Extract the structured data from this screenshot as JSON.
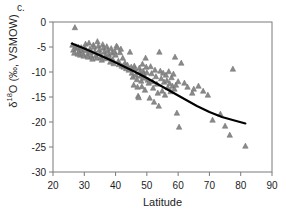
{
  "panel": {
    "label": "c."
  },
  "axes": {
    "xlabel": "Latitude",
    "ylabel_main": "O (‰, VSMOW)",
    "ylabel_delta": "δ",
    "ylabel_sup": "18",
    "x_ticks": [
      20,
      30,
      40,
      50,
      60,
      70,
      80,
      90
    ],
    "y_ticks": [
      0,
      -5,
      -10,
      -15,
      -20,
      -25,
      -30
    ]
  },
  "style": {
    "marker_color": "#8a8a8a",
    "marker_edge": "#6e6e6e",
    "trend_color": "#000000",
    "axis_color": "#7a7a7a",
    "text_color": "#1d1d1d"
  },
  "chart_data": {
    "type": "scatter",
    "title": "c.",
    "xlabel": "Latitude",
    "ylabel": "δ18O (‰, VSMOW)",
    "xlim": [
      20,
      90
    ],
    "ylim": [
      -30,
      0
    ],
    "grid": false,
    "legend": null,
    "series": [
      {
        "name": "meteoric water samples",
        "marker": "triangle",
        "color": "#8a8a8a",
        "points": [
          [
            26.2,
            -4.6
          ],
          [
            26.5,
            -5.6
          ],
          [
            26.8,
            -6.2
          ],
          [
            27.0,
            -1.1
          ],
          [
            27.3,
            -4.9
          ],
          [
            27.6,
            -5.3
          ],
          [
            27.9,
            -6.4
          ],
          [
            28.1,
            -5.0
          ],
          [
            28.4,
            -5.8
          ],
          [
            28.7,
            -6.6
          ],
          [
            29.0,
            -5.1
          ],
          [
            29.2,
            -5.5
          ],
          [
            29.5,
            -6.3
          ],
          [
            29.8,
            -6.8
          ],
          [
            30.1,
            -5.2
          ],
          [
            30.4,
            -4.4
          ],
          [
            30.7,
            -5.7
          ],
          [
            31.0,
            -6.5
          ],
          [
            31.2,
            -7.0
          ],
          [
            31.5,
            -4.2
          ],
          [
            31.8,
            -5.4
          ],
          [
            32.0,
            -6.1
          ],
          [
            32.3,
            -6.9
          ],
          [
            32.6,
            -7.4
          ],
          [
            32.9,
            -4.6
          ],
          [
            33.1,
            -5.0
          ],
          [
            33.4,
            -5.9
          ],
          [
            33.7,
            -6.7
          ],
          [
            34.0,
            -7.2
          ],
          [
            34.2,
            -3.9
          ],
          [
            34.5,
            -4.8
          ],
          [
            34.8,
            -5.6
          ],
          [
            35.0,
            -6.3
          ],
          [
            35.3,
            -7.1
          ],
          [
            35.6,
            -7.6
          ],
          [
            35.9,
            -4.5
          ],
          [
            36.1,
            -5.2
          ],
          [
            36.4,
            -6.0
          ],
          [
            36.7,
            -6.8
          ],
          [
            37.0,
            -7.3
          ],
          [
            37.2,
            -4.9
          ],
          [
            37.5,
            -5.7
          ],
          [
            37.8,
            -6.5
          ],
          [
            38.0,
            -7.0
          ],
          [
            38.3,
            -8.0
          ],
          [
            38.6,
            -5.3
          ],
          [
            38.9,
            -6.2
          ],
          [
            39.1,
            -7.5
          ],
          [
            39.4,
            -8.3
          ],
          [
            39.7,
            -5.9
          ],
          [
            40.0,
            -6.6
          ],
          [
            40.3,
            -4.8
          ],
          [
            40.6,
            -5.1
          ],
          [
            40.9,
            -7.8
          ],
          [
            41.1,
            -8.5
          ],
          [
            41.4,
            -6.1
          ],
          [
            41.7,
            -5.4
          ],
          [
            42.0,
            -8.8
          ],
          [
            42.3,
            -7.2
          ],
          [
            42.6,
            -9.0
          ],
          [
            43.0,
            -8.2
          ],
          [
            43.4,
            -9.3
          ],
          [
            43.8,
            -8.6
          ],
          [
            44.2,
            -9.6
          ],
          [
            44.6,
            -6.0
          ],
          [
            45.0,
            -9.0
          ],
          [
            45.2,
            -10.2
          ],
          [
            45.5,
            -11.0
          ],
          [
            45.8,
            -12.6
          ],
          [
            46.0,
            -8.8
          ],
          [
            46.2,
            -9.4
          ],
          [
            46.5,
            -10.6
          ],
          [
            46.8,
            -11.5
          ],
          [
            47.0,
            -13.0
          ],
          [
            47.2,
            -14.8
          ],
          [
            47.4,
            -15.1
          ],
          [
            47.6,
            -9.2
          ],
          [
            47.8,
            -10.0
          ],
          [
            48.0,
            -10.8
          ],
          [
            48.2,
            -11.8
          ],
          [
            48.4,
            -12.9
          ],
          [
            48.6,
            -8.4
          ],
          [
            48.8,
            -9.8
          ],
          [
            49.0,
            -10.4
          ],
          [
            49.2,
            -11.2
          ],
          [
            49.4,
            -13.6
          ],
          [
            49.6,
            -7.2
          ],
          [
            49.8,
            -9.0
          ],
          [
            50.0,
            -10.1
          ],
          [
            50.3,
            -11.6
          ],
          [
            50.6,
            -12.2
          ],
          [
            50.9,
            -15.2
          ],
          [
            51.2,
            -8.9
          ],
          [
            51.5,
            -10.3
          ],
          [
            51.8,
            -11.9
          ],
          [
            52.0,
            -13.2
          ],
          [
            52.3,
            -16.0
          ],
          [
            52.6,
            -9.6
          ],
          [
            52.9,
            -10.9
          ],
          [
            53.2,
            -12.4
          ],
          [
            53.5,
            -14.2
          ],
          [
            53.8,
            -16.8
          ],
          [
            54.0,
            -6.0
          ],
          [
            54.3,
            -9.8
          ],
          [
            54.6,
            -11.3
          ],
          [
            54.9,
            -13.8
          ],
          [
            55.2,
            -10.2
          ],
          [
            55.5,
            -12.0
          ],
          [
            55.8,
            -14.6
          ],
          [
            56.1,
            -10.6
          ],
          [
            56.4,
            -11.7
          ],
          [
            56.7,
            -13.1
          ],
          [
            57.0,
            -9.9
          ],
          [
            57.3,
            -12.3
          ],
          [
            57.6,
            -13.9
          ],
          [
            57.9,
            -11.1
          ],
          [
            58.2,
            -12.8
          ],
          [
            58.5,
            -10.4
          ],
          [
            58.8,
            -13.4
          ],
          [
            59.0,
            -7.0
          ],
          [
            59.3,
            -12.6
          ],
          [
            59.6,
            -18.2
          ],
          [
            60.0,
            -11.9
          ],
          [
            60.3,
            -21.0
          ],
          [
            61.0,
            -8.2
          ],
          [
            62.0,
            -12.2
          ],
          [
            63.0,
            -13.0
          ],
          [
            64.5,
            -14.2
          ],
          [
            65.0,
            -13.4
          ],
          [
            66.5,
            -12.8
          ],
          [
            68.0,
            -13.8
          ],
          [
            69.5,
            -14.6
          ],
          [
            71.0,
            -19.6
          ],
          [
            73.5,
            -18.4
          ],
          [
            75.0,
            -20.8
          ],
          [
            76.5,
            -22.6
          ],
          [
            77.5,
            -9.4
          ],
          [
            81.5,
            -24.8
          ]
        ]
      }
    ],
    "trend": {
      "name": "polynomial fit",
      "color": "#000000",
      "points": [
        [
          26.0,
          -4.3
        ],
        [
          30.0,
          -5.3
        ],
        [
          34.0,
          -6.4
        ],
        [
          38.0,
          -7.5
        ],
        [
          42.0,
          -8.7
        ],
        [
          46.0,
          -9.9
        ],
        [
          50.0,
          -11.2
        ],
        [
          54.0,
          -12.6
        ],
        [
          58.0,
          -14.0
        ],
        [
          62.0,
          -15.4
        ],
        [
          66.0,
          -16.8
        ],
        [
          70.0,
          -18.0
        ],
        [
          74.0,
          -19.0
        ],
        [
          78.0,
          -19.7
        ],
        [
          81.5,
          -20.3
        ]
      ]
    }
  }
}
